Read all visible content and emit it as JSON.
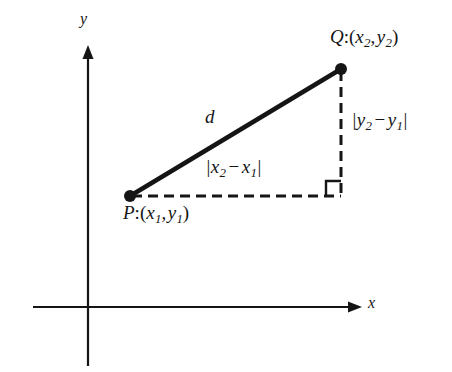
{
  "figure": {
    "name": "distance-formula-diagram",
    "background_color": "#ffffff",
    "ink_color": "#151515",
    "axes": {
      "x_axis_label": "x",
      "y_axis_label": "y",
      "origin": {
        "x": 88,
        "y": 307
      },
      "x_axis_start": {
        "x": 33,
        "y": 307
      },
      "x_axis_arrow_tip": {
        "x": 362,
        "y": 307
      },
      "y_axis_arrow_tip": {
        "x": 88,
        "y": 45
      },
      "y_axis_end": {
        "x": 88,
        "y": 366
      },
      "line_width": 2,
      "grid": false
    },
    "points": [
      {
        "id": "P",
        "label": "P:(x1, y1)",
        "label_parts": {
          "name": "P",
          "colon": ":",
          "open": "(",
          "x": "x",
          "x_sub": "1",
          "comma": ",",
          "y": "y",
          "y_sub": "1",
          "close": ")"
        },
        "marker": {
          "x": 130,
          "y": 196,
          "radius": 6
        },
        "label_position": {
          "x": 123,
          "y": 203
        }
      },
      {
        "id": "Q",
        "label": "Q:(x2, y2)",
        "label_parts": {
          "name": "Q",
          "colon": ":",
          "open": "(",
          "x": "x",
          "x_sub": "2",
          "comma": ",",
          "y": "y",
          "y_sub": "2",
          "close": ")"
        },
        "marker": {
          "x": 341,
          "y": 69,
          "radius": 6
        },
        "label_position": {
          "x": 330,
          "y": 27
        }
      }
    ],
    "segments": [
      {
        "name": "hypotenuse",
        "label": "d",
        "style": "solid",
        "width": 4.5,
        "from": {
          "x": 130,
          "y": 196
        },
        "to": {
          "x": 341,
          "y": 69
        },
        "label_position": {
          "x": 205,
          "y": 107
        }
      },
      {
        "name": "horizontal-leg",
        "label": "|x2 - x1|",
        "label_parts": {
          "bar": "|",
          "x": "x",
          "sub_a": "2",
          "minus": "−",
          "sub_b": "1"
        },
        "style": "dashed",
        "width": 3,
        "dash_pattern": "10 6",
        "from": {
          "x": 130,
          "y": 196
        },
        "to": {
          "x": 341,
          "y": 196
        },
        "label_position": {
          "x": 206,
          "y": 157
        }
      },
      {
        "name": "vertical-leg",
        "label": "|y2 - y1|",
        "label_parts": {
          "bar": "|",
          "y": "y",
          "sub_a": "2",
          "minus": "−",
          "sub_b": "1"
        },
        "style": "dashed",
        "width": 3,
        "dash_pattern": "10 6",
        "from": {
          "x": 341,
          "y": 69
        },
        "to": {
          "x": 341,
          "y": 196
        },
        "label_position": {
          "x": 352,
          "y": 110
        }
      }
    ],
    "right_angle_marker": {
      "name": "right-angle-marker",
      "corner": {
        "x": 341,
        "y": 196
      },
      "size": 15,
      "line_width": 2
    }
  }
}
